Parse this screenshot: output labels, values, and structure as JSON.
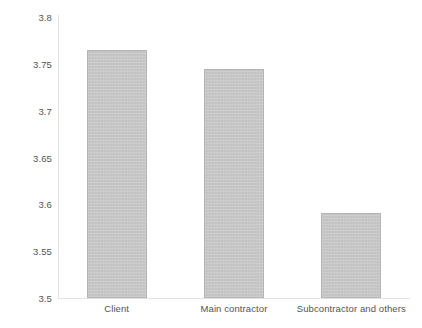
{
  "chart_data": {
    "type": "bar",
    "title": "",
    "subtitle": "",
    "xlabel": "",
    "ylabel": "",
    "categories": [
      "Client",
      "Main contractor",
      "Subcontractor and others"
    ],
    "values": [
      3.765,
      3.745,
      3.591
    ],
    "series": [
      {
        "name": "",
        "values": [
          3.765,
          3.745,
          3.591
        ]
      }
    ],
    "ylim": [
      3.5,
      3.8
    ],
    "yticks": [
      "3.5",
      "3.55",
      "3.6",
      "3.65",
      "3.7",
      "3.75",
      "3.8"
    ],
    "ytick_values": [
      3.5,
      3.55,
      3.6,
      3.65,
      3.7,
      3.75,
      3.8
    ],
    "grid": false,
    "legend": false,
    "legend_position": "none",
    "bar_color": "#c9c9c9",
    "bar_border_color": "#b4b4b4",
    "axis_color": "#e3e3e3",
    "tick_label_color": "#545454",
    "background_color": "#ffffff"
  }
}
